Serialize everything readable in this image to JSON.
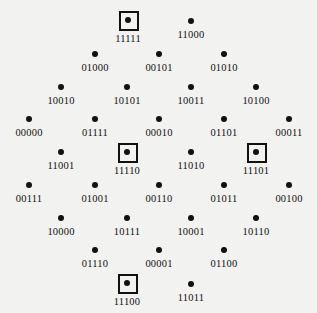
{
  "figure": {
    "background_color": "#f2f2f0",
    "dot_color": "#111111",
    "box_color": "#111111",
    "label_color": "#111111"
  },
  "chart_data": {
    "type": "scatter",
    "title": "",
    "subtitle": "",
    "xlabel": "",
    "ylabel": "",
    "grid": false,
    "legend": null,
    "annotations": [],
    "row_counts": [
      2,
      3,
      4,
      5,
      4,
      5,
      4,
      3,
      2
    ],
    "boxed_labels": [
      "11111",
      "11110",
      "11101",
      "11100"
    ],
    "points": [
      {
        "label": "11111",
        "x": 128,
        "y": 20,
        "boxed": true,
        "row": 1,
        "col": 1
      },
      {
        "label": "11000",
        "x": 191,
        "y": 21,
        "boxed": false,
        "row": 1,
        "col": 2
      },
      {
        "label": "01000",
        "x": 95,
        "y": 54,
        "boxed": false,
        "row": 2,
        "col": 1
      },
      {
        "label": "00101",
        "x": 159,
        "y": 54,
        "boxed": false,
        "row": 2,
        "col": 2
      },
      {
        "label": "01010",
        "x": 224,
        "y": 54,
        "boxed": false,
        "row": 2,
        "col": 3
      },
      {
        "label": "10010",
        "x": 61,
        "y": 87,
        "boxed": false,
        "row": 3,
        "col": 1
      },
      {
        "label": "10101",
        "x": 127,
        "y": 87,
        "boxed": false,
        "row": 3,
        "col": 2
      },
      {
        "label": "10011",
        "x": 191,
        "y": 87,
        "boxed": false,
        "row": 3,
        "col": 3
      },
      {
        "label": "10100",
        "x": 256,
        "y": 87,
        "boxed": false,
        "row": 3,
        "col": 4
      },
      {
        "label": "00000",
        "x": 29,
        "y": 119,
        "boxed": false,
        "row": 4,
        "col": 1
      },
      {
        "label": "01111",
        "x": 95,
        "y": 119,
        "boxed": false,
        "row": 4,
        "col": 2
      },
      {
        "label": "00010",
        "x": 159,
        "y": 119,
        "boxed": false,
        "row": 4,
        "col": 3
      },
      {
        "label": "01101",
        "x": 224,
        "y": 119,
        "boxed": false,
        "row": 4,
        "col": 4
      },
      {
        "label": "00011",
        "x": 289,
        "y": 119,
        "boxed": false,
        "row": 4,
        "col": 5
      },
      {
        "label": "11001",
        "x": 61,
        "y": 152,
        "boxed": false,
        "row": 5,
        "col": 1
      },
      {
        "label": "11110",
        "x": 127,
        "y": 152,
        "boxed": true,
        "row": 5,
        "col": 2
      },
      {
        "label": "11010",
        "x": 191,
        "y": 152,
        "boxed": false,
        "row": 5,
        "col": 3
      },
      {
        "label": "11101",
        "x": 256,
        "y": 152,
        "boxed": true,
        "row": 5,
        "col": 4
      },
      {
        "label": "00111",
        "x": 29,
        "y": 185,
        "boxed": false,
        "row": 6,
        "col": 1
      },
      {
        "label": "01001",
        "x": 95,
        "y": 185,
        "boxed": false,
        "row": 6,
        "col": 2
      },
      {
        "label": "00110",
        "x": 159,
        "y": 185,
        "boxed": false,
        "row": 6,
        "col": 3
      },
      {
        "label": "01011",
        "x": 224,
        "y": 185,
        "boxed": false,
        "row": 6,
        "col": 4
      },
      {
        "label": "00100",
        "x": 289,
        "y": 185,
        "boxed": false,
        "row": 6,
        "col": 5
      },
      {
        "label": "10000",
        "x": 61,
        "y": 218,
        "boxed": false,
        "row": 7,
        "col": 1
      },
      {
        "label": "10111",
        "x": 127,
        "y": 218,
        "boxed": false,
        "row": 7,
        "col": 2
      },
      {
        "label": "10001",
        "x": 191,
        "y": 218,
        "boxed": false,
        "row": 7,
        "col": 3
      },
      {
        "label": "10110",
        "x": 256,
        "y": 218,
        "boxed": false,
        "row": 7,
        "col": 4
      },
      {
        "label": "01110",
        "x": 95,
        "y": 250,
        "boxed": false,
        "row": 8,
        "col": 1
      },
      {
        "label": "00001",
        "x": 159,
        "y": 250,
        "boxed": false,
        "row": 8,
        "col": 2
      },
      {
        "label": "01100",
        "x": 224,
        "y": 250,
        "boxed": false,
        "row": 8,
        "col": 3
      },
      {
        "label": "11100",
        "x": 127,
        "y": 283,
        "boxed": true,
        "row": 9,
        "col": 1
      },
      {
        "label": "11011",
        "x": 191,
        "y": 284,
        "boxed": false,
        "row": 9,
        "col": 2
      }
    ]
  }
}
